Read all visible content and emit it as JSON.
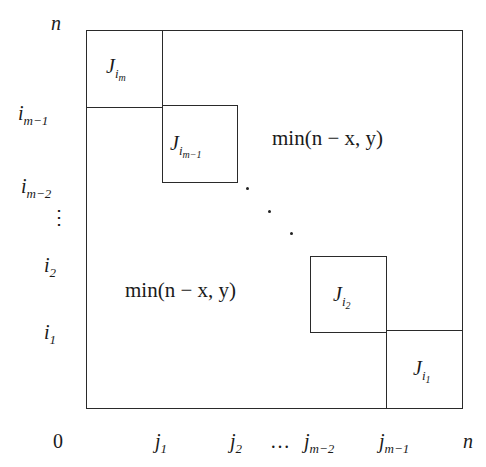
{
  "diagram": {
    "type": "block-diagonal matrix partition",
    "outer_box": {
      "corner_top_left": "n",
      "corner_bottom_left": "0",
      "corner_bottom_right": "n"
    },
    "blocks": [
      {
        "name": "J",
        "sub": "i",
        "subsub": "m"
      },
      {
        "name": "J",
        "sub": "i",
        "subsub": "m−1"
      },
      {
        "name": "J",
        "sub": "i",
        "subsub": "2"
      },
      {
        "name": "J",
        "sub": "i",
        "subsub": "1"
      }
    ],
    "regions": {
      "upper_right": "min(n − x, y)",
      "lower_left": "min(n − x, y)"
    },
    "y_axis_labels": [
      {
        "base": "n",
        "sub": ""
      },
      {
        "base": "i",
        "sub": "m−1"
      },
      {
        "base": "i",
        "sub": "m−2"
      },
      {
        "base": "⋮",
        "sub": ""
      },
      {
        "base": "i",
        "sub": "2"
      },
      {
        "base": "i",
        "sub": "1"
      }
    ],
    "x_axis_labels": [
      {
        "base": "0",
        "sub": ""
      },
      {
        "base": "j",
        "sub": "1"
      },
      {
        "base": "j",
        "sub": "2"
      },
      {
        "base": "…",
        "sub": ""
      },
      {
        "base": "j",
        "sub": "m−2"
      },
      {
        "base": "j",
        "sub": "m−1"
      },
      {
        "base": "n",
        "sub": ""
      }
    ]
  }
}
